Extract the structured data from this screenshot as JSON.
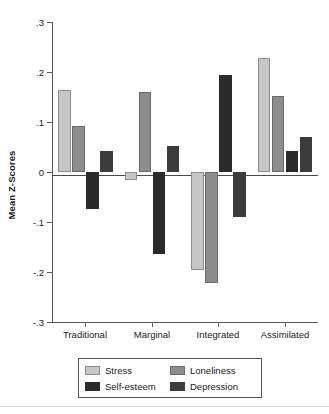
{
  "chart_data": {
    "type": "bar",
    "title": "",
    "xlabel": "",
    "ylabel": "Mean Z-Scores",
    "ylim": [
      -0.3,
      0.3
    ],
    "yticks": [
      0.3,
      0.2,
      0.1,
      0,
      -0.1,
      -0.2,
      -0.3
    ],
    "ytick_labels": [
      ".3",
      ".2",
      ".1",
      "0",
      "-.1",
      "-.2",
      "-.3"
    ],
    "grid": false,
    "legend_position": "bottom",
    "categories": [
      "Traditional",
      "Marginal",
      "Integrated",
      "Assimilated"
    ],
    "series": [
      {
        "name": "Stress",
        "color": "#c6c6c6",
        "values": [
          0.165,
          -0.015,
          -0.195,
          0.228
        ]
      },
      {
        "name": "Loneliness",
        "color": "#8d8d8d",
        "values": [
          0.092,
          0.161,
          -0.221,
          0.152
        ]
      },
      {
        "name": "Self-esteem",
        "color": "#2b2b2b",
        "values": [
          -0.073,
          -0.163,
          0.194,
          0.042
        ]
      },
      {
        "name": "Depression",
        "color": "#3b3b3b",
        "values": [
          0.043,
          0.052,
          -0.089,
          0.07
        ]
      }
    ]
  },
  "legend": {
    "items": [
      {
        "label": "Stress",
        "icon": "legend-swatch-stress"
      },
      {
        "label": "Loneliness",
        "icon": "legend-swatch-loneliness"
      },
      {
        "label": "Self-esteem",
        "icon": "legend-swatch-self-esteem"
      },
      {
        "label": "Depression",
        "icon": "legend-swatch-depression"
      }
    ]
  }
}
